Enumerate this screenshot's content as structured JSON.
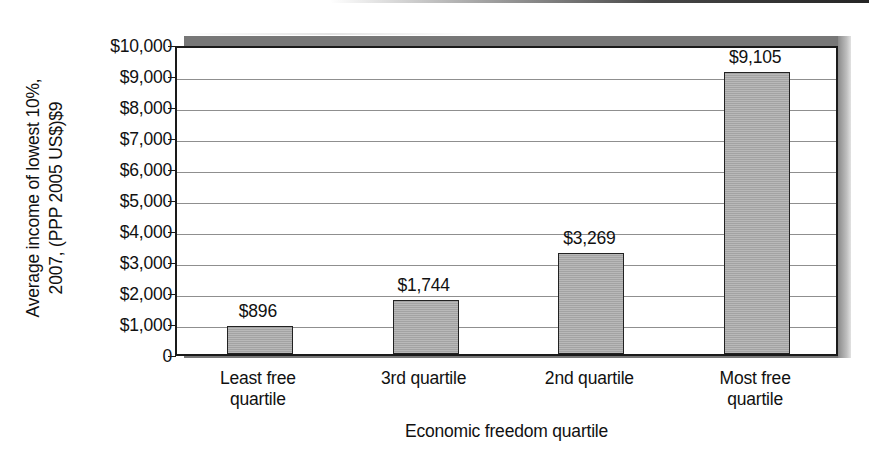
{
  "chart_data": {
    "type": "bar",
    "title": "",
    "subtitle": "",
    "xlabel": "Economic freedom quartile",
    "ylabel": "Average income of lowest 10%, 2007, (PPP 2005 US$)$9",
    "ylabel_lines": [
      "Average income of lowest 10%,",
      "2007, (PPP 2005 US$)$9"
    ],
    "categories": [
      "Least free quartile",
      "3rd quartile",
      "2nd quartile",
      "Most free quartile"
    ],
    "category_lines": [
      [
        "Least free",
        "quartile"
      ],
      [
        "3rd quartile",
        ""
      ],
      [
        "2nd quartile",
        ""
      ],
      [
        "Most free",
        "quartile"
      ]
    ],
    "values": [
      896,
      1744,
      3269,
      9105
    ],
    "value_labels": [
      "$896",
      "$1,744",
      "$3,269",
      "$9,105"
    ],
    "ylim": [
      0,
      10000
    ],
    "ytick_values": [
      10000,
      9000,
      8000,
      7000,
      6000,
      5000,
      4000,
      3000,
      2000,
      1000,
      0
    ],
    "ytick_labels": [
      "$10,000",
      "$9,000",
      "$8,000",
      "$7,000",
      "$6,000",
      "$5,000",
      "$4,000",
      "$3,000",
      "$2,000",
      "$1,000",
      "0"
    ],
    "grid": true,
    "legend": false,
    "legend_position": "none",
    "colors": {
      "bar_fill": "#acacac",
      "bar_border": "#222222",
      "gridline": "#8f8f8f",
      "axis": "#1a1a1a",
      "plot_background": "#ffffff",
      "shadow": "#777777",
      "text": "#111111"
    }
  }
}
